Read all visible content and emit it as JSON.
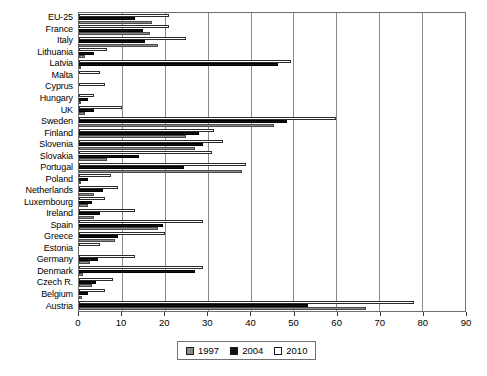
{
  "chart_data": {
    "type": "bar",
    "orientation": "horizontal",
    "title": "",
    "xlabel": "",
    "ylabel": "",
    "xlim": [
      0,
      90
    ],
    "xticks": [
      0,
      10,
      20,
      30,
      40,
      50,
      60,
      70,
      80,
      90
    ],
    "grid": true,
    "legend_position": "bottom-center",
    "categories": [
      "EU-25",
      "France",
      "Italy",
      "Lithuania",
      "Latvia",
      "Malta",
      "Cyprus",
      "Hungary",
      "UK",
      "Sweden",
      "Finland",
      "Slovenia",
      "Slovakia",
      "Portugal",
      "Poland",
      "Netherlands",
      "Luxembourg",
      "Ireland",
      "Spain",
      "Greece",
      "Estonia",
      "Germany",
      "Denmark",
      "Czech R.",
      "Belgium",
      "Austria"
    ],
    "series": [
      {
        "name": "1997",
        "color": "#8c8c8c",
        "values": [
          17.0,
          16.5,
          18.5,
          1.5,
          0.3,
          0.0,
          0.0,
          0.3,
          1.3,
          45.5,
          25.0,
          27.0,
          6.5,
          38.0,
          0.4,
          3.5,
          2.0,
          3.5,
          18.5,
          8.5,
          0.0,
          2.5,
          1.0,
          3.0,
          0.6,
          67.0
        ]
      },
      {
        "name": "2004",
        "color": "#111111",
        "values": [
          13.0,
          15.0,
          15.5,
          3.5,
          46.5,
          0.0,
          0.0,
          2.0,
          3.5,
          48.5,
          28.0,
          29.0,
          14.0,
          24.5,
          2.0,
          5.5,
          3.0,
          5.0,
          19.5,
          9.0,
          0.0,
          4.5,
          27.0,
          4.0,
          2.0,
          53.5
        ]
      },
      {
        "name": "2010",
        "color": "#ffffff",
        "values": [
          21.0,
          21.0,
          25.0,
          6.5,
          49.5,
          5.0,
          6.0,
          3.5,
          10.0,
          60.0,
          31.5,
          33.5,
          31.0,
          39.0,
          7.5,
          9.0,
          6.0,
          13.0,
          29.0,
          20.0,
          5.0,
          13.0,
          29.0,
          8.0,
          6.0,
          78.0
        ]
      }
    ]
  },
  "legend": {
    "entries": [
      {
        "label": "1997",
        "class": "s1997"
      },
      {
        "label": "2004",
        "class": "s2004"
      },
      {
        "label": "2010",
        "class": "s2010"
      }
    ]
  }
}
